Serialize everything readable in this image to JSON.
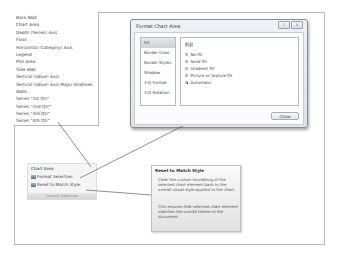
{
  "element_list": {
    "items": [
      "Back Wall",
      "Chart Area",
      "Depth (Series) Axis",
      "Floor",
      "Horizontal (Category) Axis",
      "Legend",
      "Plot Area",
      "Side Wall",
      "Vertical (Value) Axis",
      "Vertical (Value) Axis Major Gridlines",
      "Walls",
      "Series \"1st Qtr\"",
      "Series \"2nd Qtr\"",
      "Series \"3rd Qtr\"",
      "Series \"4th Qtr\""
    ]
  },
  "dialog": {
    "title": "Format Chart Area",
    "help_button": "?",
    "close_x_button": "X",
    "nav": [
      "Fill",
      "Border Color",
      "Border Styles",
      "Shadow",
      "3-D Format",
      "3-D Rotation"
    ],
    "selected_nav": "Fill",
    "pane_heading": "Fill",
    "fill_options": [
      {
        "label": "No fill",
        "selected": false
      },
      {
        "label": "Solid fill",
        "selected": false
      },
      {
        "label": "Gradient fill",
        "selected": false
      },
      {
        "label": "Picture or texture fill",
        "selected": false
      },
      {
        "label": "Automatic",
        "selected": true
      }
    ],
    "close_label": "Close"
  },
  "mini_panel": {
    "title": "Chart Area",
    "format_selection": "Format Selection",
    "reset_to_match_style": "Reset to Match Style",
    "footer": "Current Selection"
  },
  "tooltip": {
    "title": "Reset to Match Style",
    "paragraph1": "Clear the custom formatting of the selected chart element back to the overall visual style applied to the chart.",
    "paragraph2": "This ensures that selected chart element matches the overall theme of the document."
  }
}
